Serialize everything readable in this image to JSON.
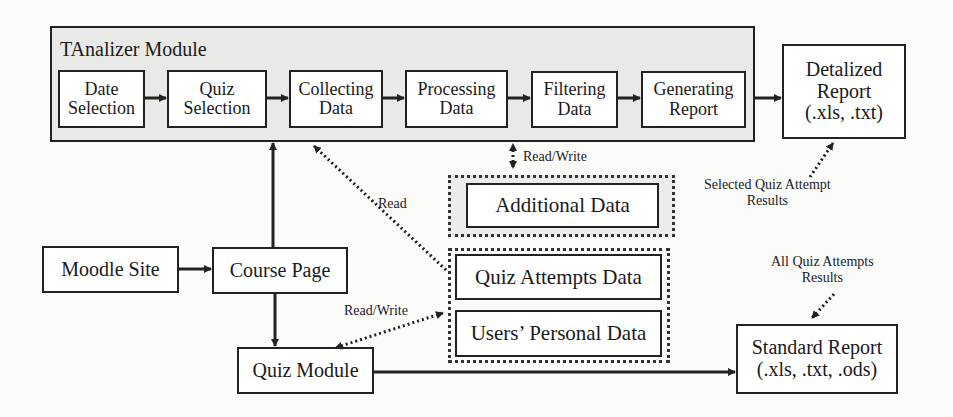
{
  "module": {
    "title": "TAnalizer Module",
    "steps": [
      {
        "id": "date-selection",
        "label": "Date\nSelection"
      },
      {
        "id": "quiz-selection",
        "label": "Quiz\nSelection"
      },
      {
        "id": "collecting-data",
        "label": "Collecting\nData"
      },
      {
        "id": "processing-data",
        "label": "Processing\nData"
      },
      {
        "id": "filtering-data",
        "label": "Filtering\nData"
      },
      {
        "id": "generating-report",
        "label": "Generating\nReport"
      }
    ]
  },
  "outputs": {
    "detalized_report": "Detalized\nReport\n(.xls, .txt)",
    "standard_report": "Standard Report\n(.xls, .txt, .ods)"
  },
  "data_stores": {
    "additional": "Additional Data",
    "quiz_attempts": "Quiz Attempts Data",
    "users_personal": "Users’ Personal Data"
  },
  "moodle": {
    "site": "Moodle Site",
    "course_page": "Course Page",
    "quiz_module": "Quiz Module"
  },
  "labels": {
    "read_write_top": "Read/Write",
    "read": "Read",
    "read_write_bottom": "Read/Write",
    "selected_results": "Selected Quiz Attempt\nResults",
    "all_results": "All Quiz Attempts\nResults"
  },
  "colors": {
    "stroke": "#222222",
    "module_fill": "#e9e9e7",
    "box_fill": "#ffffff",
    "background": "#fbfbfa"
  }
}
